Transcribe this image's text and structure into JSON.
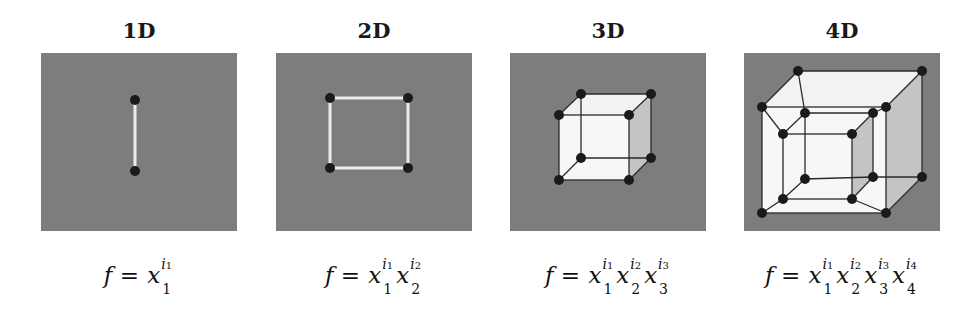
{
  "figure": {
    "background": "#ffffff",
    "panel_color": "#7d7d7d",
    "edge_color_flat": "#ececec",
    "face_color_light": "#f2f2f2",
    "face_color_shaded": "#c4c4c4",
    "vertex_color": "#1a1a1a",
    "panels": [
      {
        "title": "1D",
        "formula": {
          "lhs": "f",
          "eq": "=",
          "terms": [
            {
              "base": "x",
              "sub": "1",
              "exp": "i",
              "exp_sub": "1"
            }
          ]
        },
        "vertices": 2
      },
      {
        "title": "2D",
        "formula": {
          "lhs": "f",
          "eq": "=",
          "terms": [
            {
              "base": "x",
              "sub": "1",
              "exp": "i",
              "exp_sub": "1"
            },
            {
              "base": "x",
              "sub": "2",
              "exp": "i",
              "exp_sub": "2"
            }
          ]
        },
        "vertices": 4
      },
      {
        "title": "3D",
        "formula": {
          "lhs": "f",
          "eq": "=",
          "terms": [
            {
              "base": "x",
              "sub": "1",
              "exp": "i",
              "exp_sub": "1"
            },
            {
              "base": "x",
              "sub": "2",
              "exp": "i",
              "exp_sub": "2"
            },
            {
              "base": "x",
              "sub": "3",
              "exp": "i",
              "exp_sub": "3"
            }
          ]
        },
        "vertices": 8
      },
      {
        "title": "4D",
        "formula": {
          "lhs": "f",
          "eq": "=",
          "terms": [
            {
              "base": "x",
              "sub": "1",
              "exp": "i",
              "exp_sub": "1"
            },
            {
              "base": "x",
              "sub": "2",
              "exp": "i",
              "exp_sub": "2"
            },
            {
              "base": "x",
              "sub": "3",
              "exp": "i",
              "exp_sub": "3"
            },
            {
              "base": "x",
              "sub": "4",
              "exp": "i",
              "exp_sub": "4"
            }
          ]
        },
        "vertices": 16
      }
    ]
  }
}
